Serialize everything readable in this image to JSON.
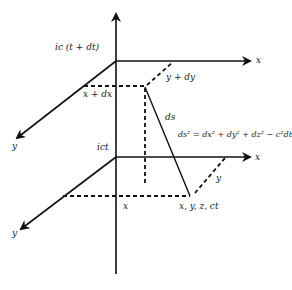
{
  "diagram": {
    "type": "spacetime-interval",
    "labels": {
      "top_time": "ic (t + dt)",
      "bottom_time": "ict",
      "x_upper": "x",
      "x_lower": "x",
      "y_upper": "y",
      "y_lower": "y",
      "x_plus_dx": "x + dx",
      "y_plus_dy": "y + dy",
      "ds": "ds",
      "equation": "ds² = dx² + dy² + dz² − c²dt²",
      "x_coord": "x",
      "y_coord": "y",
      "event": "x, y, z, ct"
    },
    "colors": {
      "line": "#111111",
      "background": "#ffffff"
    }
  }
}
